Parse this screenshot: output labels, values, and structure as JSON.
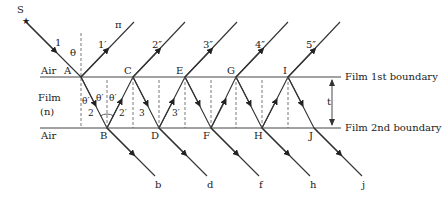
{
  "diagram": {
    "type": "thin-film multiple reflection interference",
    "source_label": "S",
    "medium_labels": {
      "air_top": "Air",
      "film": "Film",
      "film_index": "(n)",
      "air_bottom": "Air"
    },
    "boundary_labels": {
      "first": "Film 1st boundary",
      "second": "Film 2nd boundary"
    },
    "thickness_label": "t",
    "points_top": [
      "A",
      "C",
      "E",
      "G",
      "I"
    ],
    "points_bottom": [
      "B",
      "D",
      "F",
      "H",
      "J"
    ],
    "ray_labels": {
      "incident": "1",
      "reflected_first": "1′",
      "pi": "π"
    },
    "reflected_rays": [
      "2″",
      "3″",
      "4″",
      "5″"
    ],
    "transmitted_rays": [
      "b",
      "d",
      "f",
      "h",
      "j"
    ],
    "internal_labels": [
      "2",
      "2′",
      "3",
      "3′"
    ],
    "angle_labels": {
      "incidence": "θ",
      "refraction": "θ′"
    }
  }
}
